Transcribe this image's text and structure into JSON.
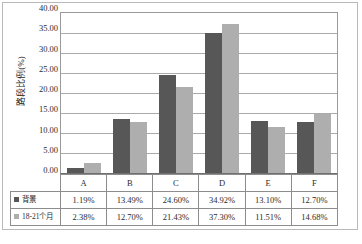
{
  "chart_data": {
    "type": "bar",
    "title": "",
    "subtitle": "",
    "xlabel": "",
    "ylabel": "路段比例(%)",
    "categories": [
      "A",
      "B",
      "C",
      "D",
      "E",
      "F"
    ],
    "series": [
      {
        "name": "背景",
        "legend_icon": "square-marker-dark",
        "color": "#575757",
        "values": [
          1.19,
          13.49,
          24.6,
          34.92,
          13.1,
          12.7
        ],
        "labels": [
          "1.19%",
          "13.49%",
          "24.60%",
          "34.92%",
          "13.10%",
          "12.70%"
        ]
      },
      {
        "name": "18-21个月",
        "legend_icon": "square-marker-light",
        "color": "#aeaeae",
        "values": [
          2.38,
          12.7,
          21.43,
          37.3,
          11.51,
          14.68
        ],
        "labels": [
          "2.38%",
          "12.70%",
          "21.43%",
          "37.30%",
          "11.51%",
          "14.68%"
        ]
      }
    ],
    "ylim": [
      0,
      40
    ],
    "ytick_step": 5,
    "ytick_labels": [
      "40.00",
      "35.00",
      "30.00",
      "25.00",
      "20.00",
      "15.00",
      "10.00",
      "5.00",
      "0.00"
    ],
    "ytick_values": [
      40,
      35,
      30,
      25,
      20,
      15,
      10,
      5,
      0
    ],
    "grid": true,
    "grid_axis": "y",
    "legend_position": "data-table-left-column",
    "data_table_visible": true
  }
}
